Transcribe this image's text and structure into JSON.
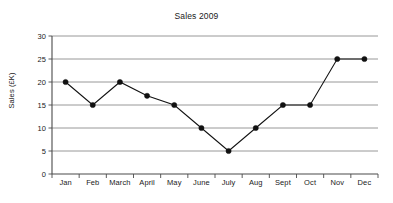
{
  "chart_data": {
    "type": "line",
    "title": "Sales 2009",
    "xlabel": "",
    "ylabel": "Sales (£K)",
    "categories": [
      "Jan",
      "Feb",
      "March",
      "April",
      "May",
      "June",
      "July",
      "Aug",
      "Sept",
      "Oct",
      "Nov",
      "Dec"
    ],
    "values": [
      20,
      15,
      20,
      17,
      15,
      10,
      5,
      10,
      15,
      15,
      25,
      25
    ],
    "series": [
      {
        "name": "Sales 2009",
        "values": [
          20,
          15,
          20,
          17,
          15,
          10,
          5,
          10,
          15,
          15,
          25,
          25
        ]
      }
    ],
    "ylim": [
      0,
      30
    ],
    "ytick_labels": [
      "0",
      "5",
      "10",
      "15",
      "20",
      "25",
      "30"
    ],
    "ytick_values": [
      0,
      5,
      10,
      15,
      20,
      25,
      30
    ],
    "grid": "horizontal",
    "legend": "none",
    "marker": "filled-circle",
    "line_color": "#111111",
    "grid_color": "#8d8d8d",
    "axis_color": "#4a4a4a",
    "background_color": "#ffffff"
  }
}
